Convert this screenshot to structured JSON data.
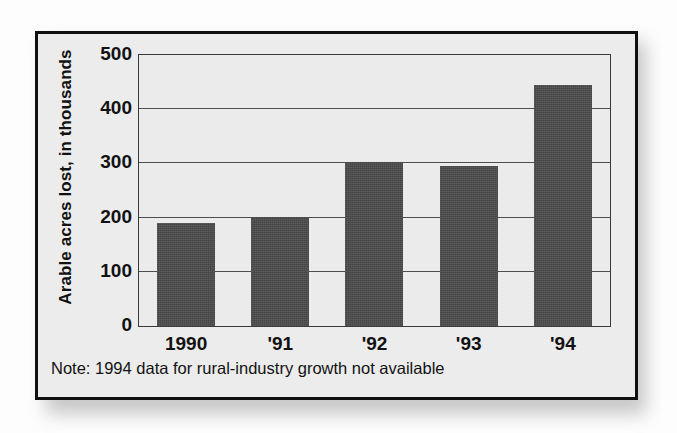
{
  "figure": {
    "note": "Note: 1994 data for rural-industry growth not available",
    "frame_color": "#101010",
    "panel_color": "#ececec",
    "plot_background": "#ebebeb",
    "bar_color": "#4b4b4b",
    "gridline_color": "#4e4e4e"
  },
  "chart_data": {
    "type": "bar",
    "title": "",
    "xlabel": "",
    "ylabel": "Arable acres lost, in thousands",
    "categories": [
      "1990",
      "'91",
      "'92",
      "'93",
      "'94"
    ],
    "values": [
      190,
      200,
      302,
      296,
      445
    ],
    "ylim": [
      0,
      500
    ],
    "yticks": [
      0,
      100,
      200,
      300,
      400,
      500
    ],
    "ytick_labels": [
      "0",
      "100",
      "200",
      "300",
      "400",
      "500"
    ],
    "grid": true,
    "grid_axis": "y",
    "legend": false,
    "annotations": [
      "Note: 1994 data for rural-industry growth not available"
    ]
  }
}
